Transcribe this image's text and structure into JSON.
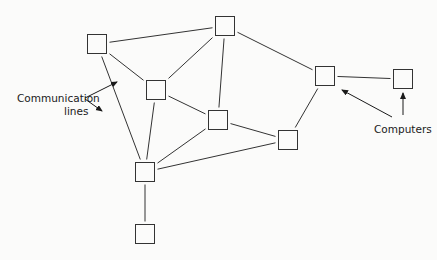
{
  "diagram": {
    "type": "network",
    "node_shape": "square",
    "line_color": "#333333",
    "node_fill": "#fbfbfa",
    "nodes": [
      {
        "id": "A",
        "x": 97,
        "y": 44
      },
      {
        "id": "B",
        "x": 225,
        "y": 26
      },
      {
        "id": "C",
        "x": 156,
        "y": 90
      },
      {
        "id": "D",
        "x": 218,
        "y": 120
      },
      {
        "id": "E",
        "x": 325,
        "y": 76
      },
      {
        "id": "F",
        "x": 403,
        "y": 79
      },
      {
        "id": "G",
        "x": 288,
        "y": 140
      },
      {
        "id": "H",
        "x": 145,
        "y": 172
      },
      {
        "id": "I",
        "x": 145,
        "y": 234
      }
    ],
    "edges": [
      [
        "A",
        "B"
      ],
      [
        "A",
        "C"
      ],
      [
        "A",
        "H"
      ],
      [
        "B",
        "C"
      ],
      [
        "B",
        "D"
      ],
      [
        "B",
        "E"
      ],
      [
        "C",
        "D"
      ],
      [
        "C",
        "H"
      ],
      [
        "D",
        "G"
      ],
      [
        "D",
        "H"
      ],
      [
        "E",
        "F"
      ],
      [
        "E",
        "G"
      ],
      [
        "G",
        "H"
      ],
      [
        "H",
        "I"
      ]
    ],
    "labels": {
      "communication_line1": "Communication",
      "communication_line2": "lines",
      "computers": "Computers"
    }
  }
}
